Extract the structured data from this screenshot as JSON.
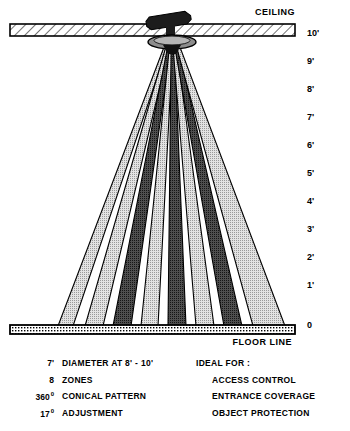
{
  "diagram": {
    "title_ceiling": "CEILING",
    "title_floor": "FLOOR LINE",
    "apex": {
      "x": 172,
      "y": 45
    },
    "ceiling_bar": {
      "x1": 10,
      "x2": 295,
      "y": 24,
      "height": 12
    },
    "floor_bar": {
      "x1": 10,
      "x2": 295,
      "y": 325,
      "height": 9
    },
    "scale": {
      "unit": "feet",
      "labels": [
        "10'",
        "9'",
        "8'",
        "7'",
        "6'",
        "5'",
        "4'",
        "3'",
        "2'",
        "1'",
        "0"
      ],
      "y_positions": [
        33,
        61,
        89,
        117,
        145,
        173,
        201,
        229,
        257,
        285,
        325
      ],
      "x": 307
    },
    "colors": {
      "beam_light": "#c9c9c9",
      "beam_dark": "#4a4a4a",
      "outline": "#000000",
      "bar_fill": "#ffffff",
      "sensor": "#1a1a1a"
    },
    "beams": [
      {
        "index": 1,
        "tone": "light",
        "floor_x1": 58,
        "floor_x2": 73,
        "apex_offset": -5.6
      },
      {
        "index": 2,
        "tone": "light",
        "floor_x1": 85,
        "floor_x2": 103,
        "apex_offset": -4.0
      },
      {
        "index": 3,
        "tone": "dark",
        "floor_x1": 113,
        "floor_x2": 131,
        "apex_offset": -2.4
      },
      {
        "index": 4,
        "tone": "light",
        "floor_x1": 141,
        "floor_x2": 158,
        "apex_offset": -0.8
      },
      {
        "index": 5,
        "tone": "dark",
        "floor_x1": 168,
        "floor_x2": 186,
        "apex_offset": 0.8
      },
      {
        "index": 6,
        "tone": "light",
        "floor_x1": 196,
        "floor_x2": 214,
        "apex_offset": 2.4
      },
      {
        "index": 7,
        "tone": "dark",
        "floor_x1": 224,
        "floor_x2": 242,
        "apex_offset": 4.0
      },
      {
        "index": 8,
        "tone": "light",
        "floor_x1": 253,
        "floor_x2": 285,
        "apex_offset": 5.6
      }
    ]
  },
  "specs": {
    "rows": [
      {
        "value": "7'",
        "degree": "",
        "name": "DIAMETER AT 8' - 10'"
      },
      {
        "value": "8",
        "degree": "",
        "name": "ZONES"
      },
      {
        "value": "360",
        "degree": "0",
        "name": "CONICAL PATTERN"
      },
      {
        "value": "17",
        "degree": "0",
        "name": "ADJUSTMENT"
      }
    ],
    "ideal_heading": "IDEAL FOR :",
    "ideal_items": [
      "ACCESS CONTROL",
      "ENTRANCE COVERAGE",
      "OBJECT PROTECTION"
    ]
  }
}
